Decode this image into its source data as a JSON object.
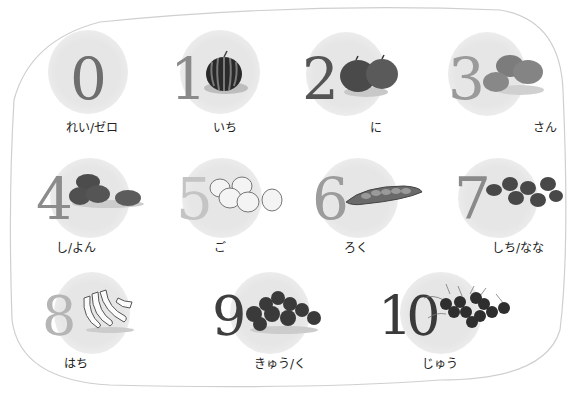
{
  "items": [
    {
      "digit": "0",
      "reading": "れい/ゼロ",
      "fruit": "none",
      "color": "#6e6e6e"
    },
    {
      "digit": "1",
      "reading": "いち",
      "fruit": "watermelon",
      "color": "#8a8a8a"
    },
    {
      "digit": "2",
      "reading": "に",
      "fruit": "apples",
      "color": "#555555"
    },
    {
      "digit": "3",
      "reading": "さん",
      "fruit": "mandarins",
      "color": "#9a9a9a"
    },
    {
      "digit": "4",
      "reading": "し/よん",
      "fruit": "potatoes",
      "color": "#8c8c8c"
    },
    {
      "digit": "5",
      "reading": "ご",
      "fruit": "onions",
      "color": "#c4c4c4"
    },
    {
      "digit": "6",
      "reading": "ろく",
      "fruit": "pea-pod",
      "color": "#9c9c9c"
    },
    {
      "digit": "7",
      "reading": "しち/なな",
      "fruit": "strawberries",
      "color": "#8a8a8a"
    },
    {
      "digit": "8",
      "reading": "はち",
      "fruit": "bananas",
      "color": "#b5b5b5"
    },
    {
      "digit": "9",
      "reading": "きゅう/く",
      "fruit": "plums",
      "color": "#3e3e3e"
    },
    {
      "digit": "10",
      "reading": "じゅう",
      "fruit": "cherries",
      "color": "#3a3a3a"
    }
  ]
}
